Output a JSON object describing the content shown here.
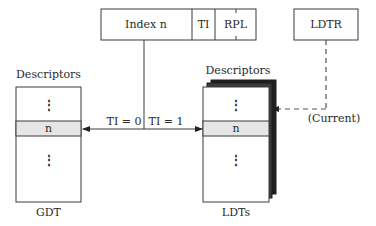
{
  "selector": {
    "index_label": "Index n",
    "ti_label": "TI",
    "rpl_label": "RPL"
  },
  "ldtr": {
    "label": "LDTR",
    "current_label": "(Current)"
  },
  "gdt": {
    "header": "Descriptors",
    "row_label": "n",
    "ellipsis": "⋮",
    "caption": "GDT"
  },
  "ldts": {
    "header": "Descriptors",
    "row_label": "n",
    "ellipsis": "⋮",
    "caption": "LDTs"
  },
  "connector": {
    "ti0_label": "TI = 0",
    "ti1_label": "TI = 1"
  },
  "colors": {
    "line": "#3a3a3a",
    "highlight_row": "#e6e6e6",
    "stack_sheet": "#1e1e1e",
    "background": "#ffffff"
  }
}
